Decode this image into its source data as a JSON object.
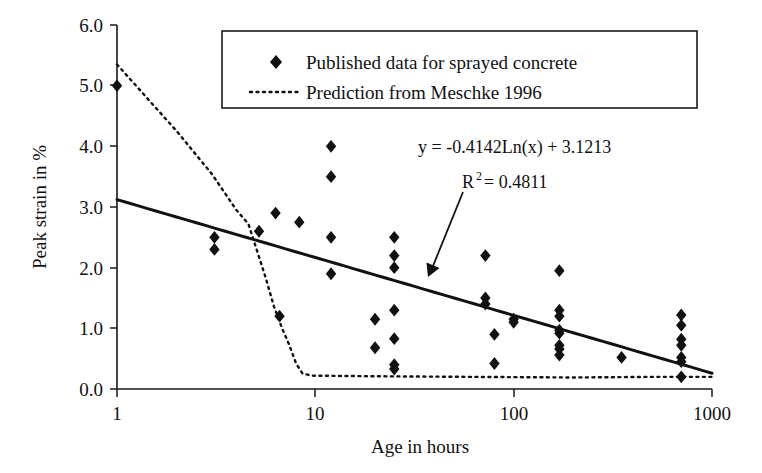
{
  "chart_data": {
    "type": "scatter",
    "title": "",
    "xlabel": "Age in hours",
    "ylabel": "Peak strain in %",
    "xscale": "log",
    "xlim": [
      1,
      1000
    ],
    "ylim": [
      0.0,
      6.0
    ],
    "xticks": [
      1,
      10,
      100,
      1000
    ],
    "xtick_labels": [
      "1",
      "10",
      "100",
      "1000"
    ],
    "yticks": [
      0.0,
      1.0,
      2.0,
      3.0,
      4.0,
      5.0,
      6.0
    ],
    "ytick_labels": [
      "0.0",
      "1.0",
      "2.0",
      "3.0",
      "4.0",
      "5.0",
      "6.0"
    ],
    "grid": false,
    "legend_position": "top-center",
    "legend": [
      {
        "label": "Published data for sprayed concrete",
        "style": "marker",
        "marker": "diamond",
        "color": "#111111"
      },
      {
        "label": "Prediction from Meschke 1996",
        "style": "dotted-line",
        "color": "#111111"
      }
    ],
    "series": [
      {
        "name": "Published data for sprayed concrete",
        "type": "scatter",
        "marker": "diamond",
        "color": "#111111",
        "points": [
          [
            1,
            5.0
          ],
          [
            3.1,
            2.5
          ],
          [
            3.1,
            2.3
          ],
          [
            5.2,
            2.6
          ],
          [
            6.3,
            2.9
          ],
          [
            6.6,
            1.2
          ],
          [
            8.3,
            2.75
          ],
          [
            12,
            4.0
          ],
          [
            12,
            3.5
          ],
          [
            12,
            2.5
          ],
          [
            12,
            1.9
          ],
          [
            20,
            1.15
          ],
          [
            20,
            0.68
          ],
          [
            25,
            2.5
          ],
          [
            25,
            2.2
          ],
          [
            25,
            2.0
          ],
          [
            25,
            1.3
          ],
          [
            25,
            0.83
          ],
          [
            25,
            0.4
          ],
          [
            25,
            0.33
          ],
          [
            72,
            2.2
          ],
          [
            72,
            1.5
          ],
          [
            72,
            1.4
          ],
          [
            80,
            0.9
          ],
          [
            80,
            0.42
          ],
          [
            100,
            1.15
          ],
          [
            100,
            1.1
          ],
          [
            170,
            1.95
          ],
          [
            170,
            1.3
          ],
          [
            170,
            1.2
          ],
          [
            170,
            0.97
          ],
          [
            170,
            0.92
          ],
          [
            170,
            0.72
          ],
          [
            170,
            0.66
          ],
          [
            170,
            0.56
          ],
          [
            350,
            0.52
          ],
          [
            700,
            1.22
          ],
          [
            700,
            1.05
          ],
          [
            700,
            0.82
          ],
          [
            700,
            0.72
          ],
          [
            700,
            0.52
          ],
          [
            700,
            0.45
          ],
          [
            700,
            0.2
          ]
        ]
      },
      {
        "name": "Prediction from Meschke 1996",
        "type": "line",
        "linestyle": "dotted",
        "color": "#111111",
        "points": [
          [
            1,
            5.35
          ],
          [
            2.0,
            4.25
          ],
          [
            3.0,
            3.55
          ],
          [
            4.0,
            2.95
          ],
          [
            4.6,
            2.72
          ],
          [
            5.0,
            2.35
          ],
          [
            5.6,
            1.85
          ],
          [
            6.2,
            1.35
          ],
          [
            6.8,
            1.0
          ],
          [
            7.4,
            0.72
          ],
          [
            8.0,
            0.42
          ],
          [
            8.6,
            0.26
          ],
          [
            9.5,
            0.22
          ],
          [
            20,
            0.21
          ],
          [
            60,
            0.2
          ],
          [
            200,
            0.19
          ],
          [
            500,
            0.2
          ],
          [
            700,
            0.2
          ],
          [
            1000,
            0.2
          ]
        ]
      },
      {
        "name": "Logarithmic trend line",
        "type": "line",
        "linestyle": "solid",
        "color": "#111111",
        "equation": "y = -0.4142*Ln(x) + 3.1213",
        "slope": -0.4142,
        "intercept": 3.1213,
        "r_squared": 0.4811,
        "points": [
          [
            1,
            3.12
          ],
          [
            1000,
            0.26
          ]
        ]
      }
    ],
    "annotations": [
      {
        "name": "equation",
        "text": "y = -0.4142Ln(x) + 3.1213"
      },
      {
        "name": "r-squared",
        "text_before": "R",
        "superscript": "2",
        "text_after": " = 0.4811"
      },
      {
        "name": "arrow",
        "from": [
          465,
          185
        ],
        "to": [
          428,
          276
        ]
      }
    ]
  },
  "axes": {
    "x_title": "Age in hours",
    "y_title": "Peak strain in %",
    "x_tick_labels": [
      "1",
      "10",
      "100",
      "1000"
    ],
    "y_tick_labels": [
      "0.0",
      "1.0",
      "2.0",
      "3.0",
      "4.0",
      "5.0",
      "6.0"
    ]
  },
  "legend": {
    "item1_label": "Published data for sprayed concrete",
    "item2_label": "Prediction from Meschke 1996"
  },
  "annotation": {
    "equation": "y = -0.4142Ln(x) + 3.1213",
    "r_label": "R",
    "r_exponent": "2",
    "r_value": "= 0.4811"
  },
  "colors": {
    "ink": "#111111",
    "background": "#ffffff"
  }
}
